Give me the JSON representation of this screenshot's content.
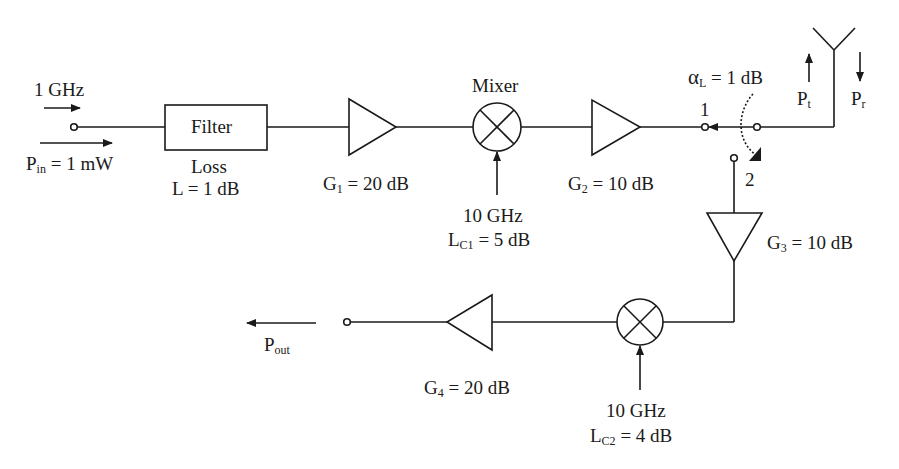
{
  "diagram": {
    "type": "rf-transceiver-block-diagram",
    "input": {
      "frequency_label": "1 GHz",
      "power_label_main": "P",
      "power_label_sub": "in",
      "power_label_rest": " = 1 mW"
    },
    "filter": {
      "label": "Filter",
      "loss_title": "Loss",
      "loss_value": "L = 1 dB"
    },
    "amp1": {
      "main": "G",
      "sub": "1",
      "rest": " = 20 dB"
    },
    "mixer1": {
      "title": "Mixer",
      "lo_freq": "10 GHz",
      "loss_main": "L",
      "loss_sub": "C1",
      "loss_rest": " = 5 dB"
    },
    "amp2": {
      "main": "G",
      "sub": "2",
      "rest": " = 10 dB"
    },
    "switch": {
      "loss_symbol": "α",
      "loss_sub": "L",
      "loss_rest": " = 1 dB",
      "port1_label": "1",
      "port2_label": "2"
    },
    "antenna": {
      "pt_main": "P",
      "pt_sub": "t",
      "pr_main": "P",
      "pr_sub": "r"
    },
    "amp3": {
      "main": "G",
      "sub": "3",
      "rest": " = 10 dB"
    },
    "mixer2": {
      "lo_freq": "10 GHz",
      "loss_main": "L",
      "loss_sub": "C2",
      "loss_rest": " = 4 dB"
    },
    "amp4": {
      "main": "G",
      "sub": "4",
      "rest": " = 20 dB"
    },
    "output": {
      "main": "P",
      "sub": "out"
    },
    "colors": {
      "ink": "#1a1a1a",
      "background": "#ffffff"
    }
  }
}
